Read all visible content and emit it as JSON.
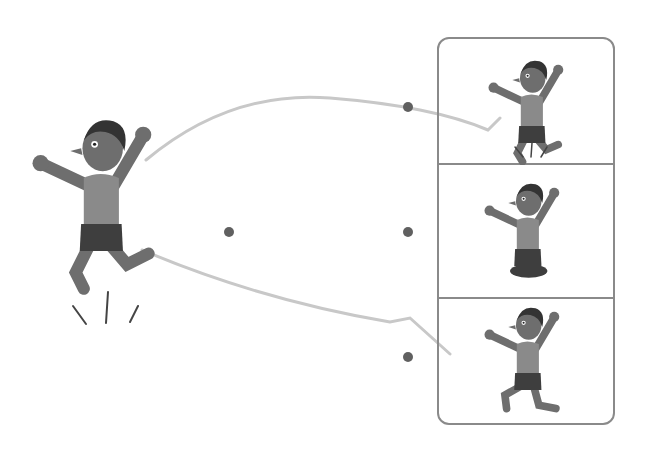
{
  "scene": {
    "description": "Boy jumping in the air; speech-bubble outline points to three option panels",
    "colors": {
      "skin": "#6e6e6e",
      "hair": "#333333",
      "shirt": "#8a8a8a",
      "shorts": "#3e3e3e",
      "outline": "#8a8a8a",
      "bubble_stroke": "#c8c8c8",
      "dot": "#606060"
    }
  },
  "main_figure": {
    "pose": "jumping",
    "expression": "worried"
  },
  "options": [
    {
      "id": 1,
      "pose": "jumping-upward",
      "has_motion_lines": true
    },
    {
      "id": 2,
      "pose": "cross-legged-floating",
      "has_motion_lines": false
    },
    {
      "id": 3,
      "pose": "kneeling-stride",
      "has_motion_lines": false
    }
  ],
  "selection_dots": [
    {
      "x": 408,
      "y": 107
    },
    {
      "x": 229,
      "y": 232
    },
    {
      "x": 408,
      "y": 232
    },
    {
      "x": 408,
      "y": 357
    }
  ]
}
